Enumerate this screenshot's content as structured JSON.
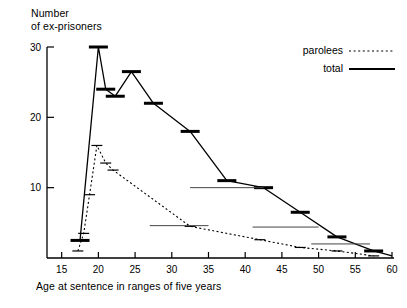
{
  "chart_data": {
    "type": "line",
    "title": "",
    "ylabel": "Number\nof ex-prisoners",
    "ylabel_line1": "Number",
    "ylabel_line2": "of ex-prisoners",
    "xlabel": "Age at sentence in ranges of five years",
    "xlim": [
      13,
      60
    ],
    "ylim": [
      0,
      30
    ],
    "xticks": [
      15,
      20,
      25,
      30,
      35,
      40,
      45,
      50,
      55,
      60
    ],
    "yticks": [
      10,
      20,
      30
    ],
    "grid": false,
    "legend_position": "top-right",
    "legend": [
      {
        "name": "parolees",
        "style": "dotted"
      },
      {
        "name": "total",
        "style": "solid"
      }
    ],
    "series": [
      {
        "name": "total",
        "style": "solid",
        "marker": "horizontal-bar",
        "points": [
          {
            "x": 17.5,
            "y": 2.5
          },
          {
            "x": 20.0,
            "y": 30.0
          },
          {
            "x": 21.0,
            "y": 24.0
          },
          {
            "x": 22.3,
            "y": 23.0
          },
          {
            "x": 24.5,
            "y": 26.5
          },
          {
            "x": 27.5,
            "y": 22.0
          },
          {
            "x": 32.5,
            "y": 18.0
          },
          {
            "x": 37.5,
            "y": 11.0
          },
          {
            "x": 42.5,
            "y": 10.0
          },
          {
            "x": 47.5,
            "y": 6.5
          },
          {
            "x": 52.5,
            "y": 3.0
          },
          {
            "x": 57.5,
            "y": 1.0
          },
          {
            "x": 60.0,
            "y": 0.3
          }
        ]
      },
      {
        "name": "parolees",
        "style": "dotted",
        "marker": "horizontal-bar",
        "points": [
          {
            "x": 17.2,
            "y": 1.0
          },
          {
            "x": 18.0,
            "y": 3.5
          },
          {
            "x": 18.8,
            "y": 9.0
          },
          {
            "x": 19.8,
            "y": 16.0
          },
          {
            "x": 21.0,
            "y": 13.5
          },
          {
            "x": 22.0,
            "y": 12.5
          },
          {
            "x": 32.5,
            "y": 4.5
          },
          {
            "x": 42.0,
            "y": 2.6
          },
          {
            "x": 47.5,
            "y": 1.5
          },
          {
            "x": 52.5,
            "y": 1.0
          },
          {
            "x": 57.5,
            "y": 0.3
          }
        ]
      }
    ]
  },
  "axes": {
    "y_title_line1": "Number",
    "y_title_line2": "of ex-prisoners",
    "x_title": "Age at sentence in ranges of five years"
  }
}
